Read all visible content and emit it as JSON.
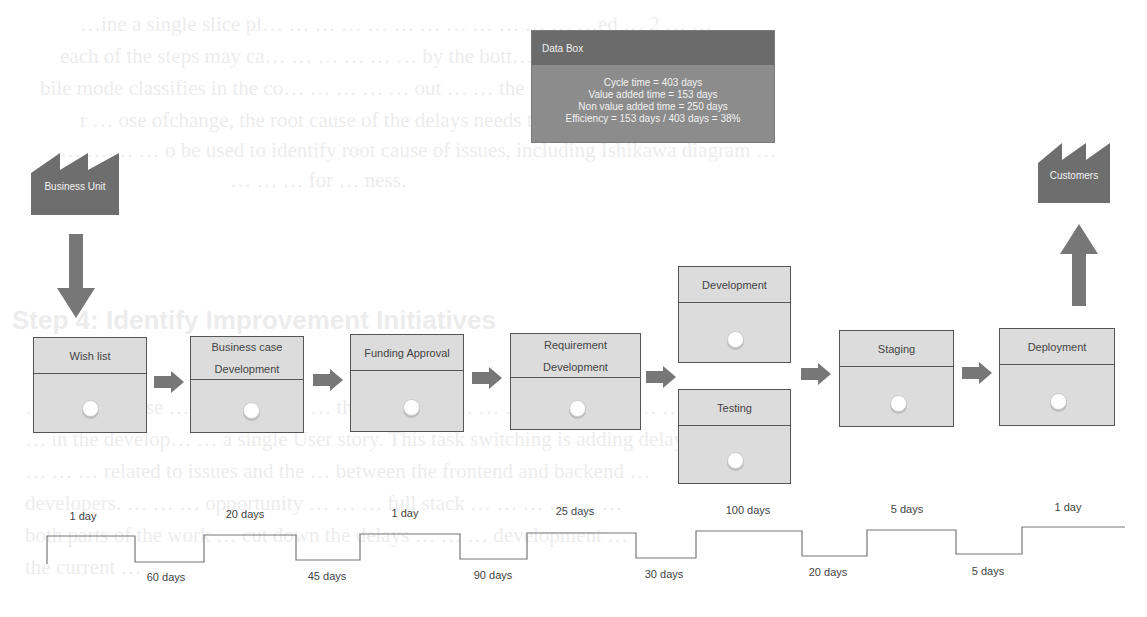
{
  "background_text": {
    "lines": [
      "…ine a single slice pl… … … … … … … … … … … … …ed … 2 … …",
      "each of the steps may ca… … … … … … by the bott… stroke … … …",
      "bile mode classifies in the co… … … … … out … … the Value … … To …",
      "r … ose ofchange, the root cause of the delays needs to be identified. … …",
      "… … … … o be used to identify root cause of issues, including Ishikawa diagram …",
      "… … … for … ness."
    ],
    "heading": "Step 4: Identify Improvement Initiatives",
    "para": [
      "… … root cause … … that … … … that … … … … …  … … … … … … …",
      "… in the develop… … a single User story. This task switching is adding delay owing to …",
      "… … … related to issues and the … between the frontend and backend …",
      "developers. … … … opportunity … … … full stack … … … … … …",
      "both parts of the work … cut down the delays … … … development …",
      "the current … …"
    ]
  },
  "data_box": {
    "title": "Data Box",
    "lines": [
      "Cycle time = 403 days",
      "Value added time = 153 days",
      "Non value added time =  250 days",
      "Efficiency = 153 days / 403 days = 38%"
    ]
  },
  "supplier": {
    "label": "Business Unit",
    "icon": "factory-icon"
  },
  "customer": {
    "label": "Customers",
    "icon": "factory-icon"
  },
  "processes": [
    {
      "id": "wish-list",
      "line1": "Wish list",
      "line2": ""
    },
    {
      "id": "business-case-development",
      "line1": "Business case",
      "line2": "Development"
    },
    {
      "id": "funding-approval",
      "line1": "Funding Approval",
      "line2": ""
    },
    {
      "id": "requirement-development",
      "line1": "Requirement",
      "line2": "Development"
    },
    {
      "id": "development",
      "line1": "Development",
      "line2": ""
    },
    {
      "id": "testing",
      "line1": "Testing",
      "line2": ""
    },
    {
      "id": "staging",
      "line1": "Staging",
      "line2": ""
    },
    {
      "id": "deployment",
      "line1": "Deployment",
      "line2": ""
    }
  ],
  "timeline": {
    "value_added": [
      "1 day",
      "20 days",
      "1 day",
      "25 days",
      "100 days",
      "5 days",
      "1 day"
    ],
    "wait_times": [
      "60 days",
      "45 days",
      "90 days",
      "30 days",
      "20 days",
      "5 days"
    ]
  },
  "colors": {
    "box_fill": "#dcdcdc",
    "box_border": "#555555",
    "arrow": "#777777",
    "factory": "#6e6e6e",
    "data_box": "#8c8c8c",
    "data_box_header": "#6b6b6b"
  }
}
